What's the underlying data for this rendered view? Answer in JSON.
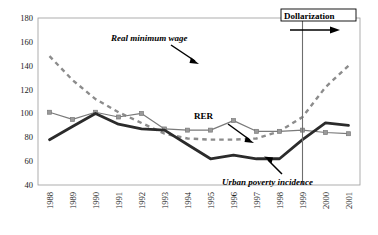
{
  "chart_data": {
    "type": "line",
    "title": "",
    "xlabel": "",
    "ylabel": "",
    "grid": false,
    "legend_position": "inline-annotations",
    "categories": [
      "1988",
      "1989",
      "1990",
      "1991",
      "1992",
      "1993",
      "1994",
      "1995",
      "1996",
      "1997",
      "1998",
      "1999",
      "2000",
      "2001"
    ],
    "ylim": [
      40,
      180
    ],
    "ytick_step": 20,
    "yticks": [
      "40",
      "60",
      "80",
      "100",
      "120",
      "140",
      "160",
      "180"
    ],
    "series": [
      {
        "name": "Real minimum wage",
        "style": "dashed",
        "color": "#8c8c8c",
        "values": [
          148,
          128,
          112,
          101,
          92,
          83,
          79,
          78,
          78,
          79,
          85,
          97,
          122,
          140
        ]
      },
      {
        "name": "RER",
        "style": "solid-thin-markers",
        "color": "#7a7a7a",
        "values": [
          101,
          95,
          101,
          97,
          100,
          87,
          86,
          86,
          94,
          85,
          85,
          86,
          84,
          83
        ]
      },
      {
        "name": "Urban poverty incidence",
        "style": "solid-thick",
        "color": "#2b2b2b",
        "values": [
          78,
          89,
          100,
          91,
          87,
          86,
          74,
          62,
          65,
          62,
          62,
          78,
          92,
          90
        ]
      }
    ],
    "annotations": [
      {
        "name": "real-minimum-wage",
        "text": "Real minimum wage",
        "italic": true
      },
      {
        "name": "rer",
        "text": "RER",
        "italic": false
      },
      {
        "name": "urban-poverty-incidence",
        "text": "Urban poverty incidence",
        "italic": true
      },
      {
        "name": "dollarization",
        "text": "Dollarization",
        "italic": false,
        "boxed": true,
        "marker_year": "1999"
      }
    ]
  }
}
